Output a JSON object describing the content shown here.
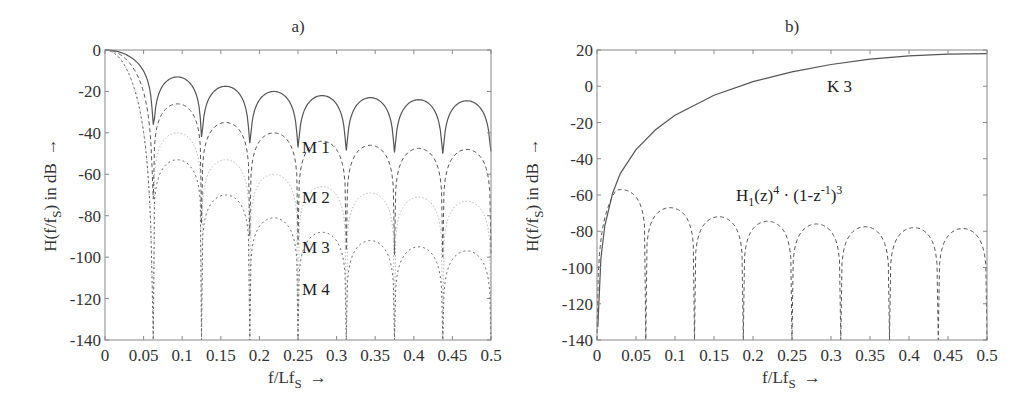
{
  "chart_data": [
    {
      "id": "a",
      "type": "line",
      "title": "a)",
      "xlabel": "f/Lf_S →",
      "ylabel": "H(f/f_S) in dB →",
      "xlim": [
        0,
        0.5
      ],
      "ylim": [
        -140,
        0
      ],
      "xticks": [
        "0",
        "0.05",
        "0.1",
        "0.15",
        "0.2",
        "0.25",
        "0.3",
        "0.35",
        "0.4",
        "0.45",
        "0.5"
      ],
      "yticks": [
        "0",
        "-20",
        "-40",
        "-60",
        "-80",
        "-100",
        "-120",
        "-140"
      ],
      "grid": false,
      "null_spacing": 0.0625,
      "series": [
        {
          "name": "M 1",
          "style": "solid",
          "color": "#555555",
          "sidelobe_peaks_db": [
            -13,
            -17.5,
            -20,
            -22,
            -23,
            -24,
            -24.5
          ],
          "nulls_db": [
            -36,
            -42,
            -45,
            -47,
            -48.5,
            -49.5,
            -50,
            -49
          ]
        },
        {
          "name": "M 2",
          "style": "dashed",
          "color": "#555555",
          "sidelobe_peaks_db": [
            -26,
            -35,
            -40,
            -44,
            -46,
            -47.5,
            -48
          ],
          "nulls_db": [
            -72,
            -84,
            -90,
            -94,
            -97,
            -99,
            -100,
            -98
          ]
        },
        {
          "name": "M 3",
          "style": "dotted-light",
          "color": "#bbbbbb",
          "sidelobe_peaks_db": [
            -40,
            -53,
            -60,
            -66,
            -69,
            -71,
            -73
          ],
          "nulls_db": [
            -140,
            -140,
            -140,
            -140,
            -140,
            -140,
            -140,
            -140
          ]
        },
        {
          "name": "M 4",
          "style": "dashdot",
          "color": "#666666",
          "sidelobe_peaks_db": [
            -53,
            -70,
            -81,
            -88,
            -92,
            -95,
            -97
          ],
          "nulls_db": [
            -140,
            -140,
            -140,
            -140,
            -140,
            -140,
            -140,
            -140
          ]
        }
      ],
      "annotations": [
        {
          "text": "M 1",
          "x": 0.265,
          "y": -31
        },
        {
          "text": "M 2",
          "x": 0.265,
          "y": -55
        },
        {
          "text": "M 3",
          "x": 0.265,
          "y": -79
        },
        {
          "text": "M 4",
          "x": 0.265,
          "y": -114
        }
      ]
    },
    {
      "id": "b",
      "type": "line",
      "title": "b)",
      "xlabel": "f/Lf_S →",
      "ylabel": "H(f/f_S) in dB →",
      "xlim": [
        0,
        0.5
      ],
      "ylim": [
        -140,
        20
      ],
      "xticks": [
        "0",
        "0.05",
        "0.1",
        "0.15",
        "0.2",
        "0.25",
        "0.3",
        "0.35",
        "0.4",
        "0.45",
        "0.5"
      ],
      "yticks": [
        "20",
        "0",
        "-20",
        "-40",
        "-60",
        "-80",
        "-100",
        "-120",
        "-140"
      ],
      "grid": false,
      "series": [
        {
          "name": "K 3",
          "style": "solid",
          "color": "#555555",
          "x": [
            0.001,
            0.005,
            0.01,
            0.02,
            0.03,
            0.05,
            0.075,
            0.1,
            0.15,
            0.2,
            0.25,
            0.3,
            0.35,
            0.4,
            0.45,
            0.5
          ],
          "y": [
            -133,
            -95,
            -77,
            -59,
            -48,
            -35,
            -24,
            -16,
            -5,
            2.5,
            8,
            12,
            15,
            16.8,
            17.7,
            18
          ]
        },
        {
          "name": "H_1(z)^4 · (1-z^-1)^3",
          "style": "dashed",
          "color": "#555555",
          "sidelobe_peaks_db": [
            -57,
            -67,
            -72,
            -74.5,
            -76,
            -77.5,
            -78,
            -78.5
          ],
          "nulls_x": [
            0.0625,
            0.125,
            0.1875,
            0.25,
            0.3125,
            0.375,
            0.4375,
            0.5
          ]
        }
      ],
      "annotations": [
        {
          "text": "K 3",
          "x": 0.3,
          "y": 3
        },
        {
          "text": "H1(z)4 · (1-z-1)3",
          "x": 0.2,
          "y": -60
        }
      ]
    }
  ],
  "labels": {
    "a_title": "a)",
    "b_title": "b)",
    "xlabel_main": "f/Lf",
    "xlabel_sub": "S",
    "xlabel_arrow": "→",
    "ylabel_pre": "H(f/f",
    "ylabel_sub": "S",
    "ylabel_post": ")  in dB",
    "ylabel_arrow": "→",
    "m1": "M 1",
    "m2": "M 2",
    "m3": "M 3",
    "m4": "M 4",
    "k3": "K 3",
    "h_H": "H",
    "h_1": "1",
    "h_z": "(z)",
    "h_4": "4",
    "h_dot": " · (1-z",
    "h_m1": "-1",
    "h_close": ")",
    "h_3": "3"
  }
}
